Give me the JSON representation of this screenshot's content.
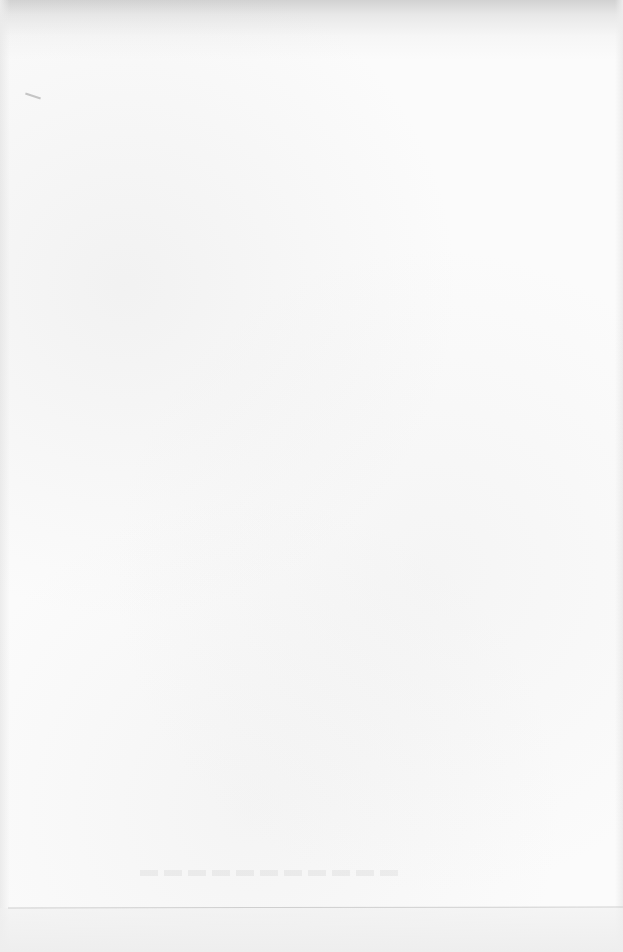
{
  "document": {
    "type": "scanned-page",
    "text": "",
    "background_color": "#fbfbfb",
    "edge_shadow_color": "#d2d2d2",
    "rule_color": "#cfcfcf"
  }
}
